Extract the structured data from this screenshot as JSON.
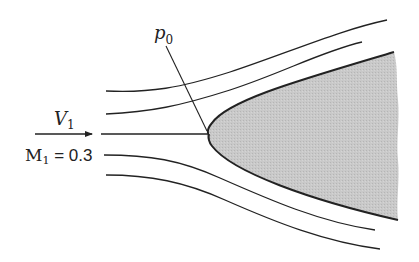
{
  "diagram": {
    "labels": {
      "velocity": "V",
      "velocity_sub": "1",
      "mach": "M",
      "mach_sub": "1",
      "mach_value": " = 0.3",
      "stagnation_pressure": "p",
      "stagnation_pressure_sub": "0"
    },
    "colors": {
      "line": "#222222",
      "body_fill": "#c4c4c4",
      "background": "#ffffff"
    },
    "streamline_count": 5
  }
}
